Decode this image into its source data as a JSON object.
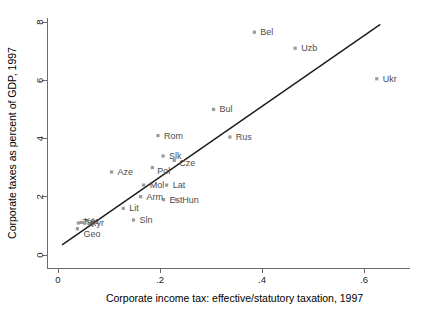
{
  "chart_data": {
    "type": "scatter",
    "title": "",
    "xlabel": "Corporate income tax: effective/statutory taxation, 1997",
    "ylabel": "Corporate taxes as percent of GDP, 1997",
    "xlim": [
      0,
      0.66
    ],
    "ylim": [
      0,
      8.3
    ],
    "xticks": [
      0,
      0.2,
      0.4,
      0.6
    ],
    "xticklabels": [
      "0",
      ".2",
      ".4",
      ".6"
    ],
    "yticks": [
      0,
      2,
      4,
      6,
      8
    ],
    "yticklabels": [
      "0",
      "2",
      "4",
      "6",
      "8"
    ],
    "grid": false,
    "legend": false,
    "marker_color": "#9a9a9a",
    "label_color": "#4d4d4d",
    "line_color": "#1a1a1a",
    "points": [
      {
        "label": "Geo",
        "x": 0.038,
        "y": 0.9,
        "label_dx": 6,
        "label_dy": 8
      },
      {
        "label": "Taj",
        "x": 0.04,
        "y": 1.1,
        "label_dx": 4,
        "label_dy": 2
      },
      {
        "label": "Kaz",
        "x": 0.046,
        "y": 1.12,
        "label_dx": 3,
        "label_dy": 2
      },
      {
        "label": "Kyr",
        "x": 0.052,
        "y": 1.1,
        "label_dx": 6,
        "label_dy": 3
      },
      {
        "label": "Sln",
        "x": 0.148,
        "y": 1.2,
        "label_dx": 6,
        "label_dy": 3
      },
      {
        "label": "Lit",
        "x": 0.128,
        "y": 1.6,
        "label_dx": 6,
        "label_dy": 3
      },
      {
        "label": "Est",
        "x": 0.207,
        "y": 1.9,
        "label_dx": 6,
        "label_dy": 3
      },
      {
        "label": "Hun",
        "x": 0.232,
        "y": 1.9,
        "label_dx": 6,
        "label_dy": 3
      },
      {
        "label": "Arm",
        "x": 0.162,
        "y": 2.0,
        "label_dx": 6,
        "label_dy": 3
      },
      {
        "label": "Mol",
        "x": 0.168,
        "y": 2.4,
        "label_dx": 6,
        "label_dy": 3
      },
      {
        "label": "Lat",
        "x": 0.213,
        "y": 2.4,
        "label_dx": 6,
        "label_dy": 3
      },
      {
        "label": "Aze",
        "x": 0.105,
        "y": 2.85,
        "label_dx": 6,
        "label_dy": 3
      },
      {
        "label": "Pol",
        "x": 0.185,
        "y": 3.0,
        "label_dx": 5,
        "label_dy": 6
      },
      {
        "label": "Cze",
        "x": 0.228,
        "y": 3.25,
        "label_dx": 5,
        "label_dy": 6
      },
      {
        "label": "Slk",
        "x": 0.206,
        "y": 3.4,
        "label_dx": 6,
        "label_dy": 3
      },
      {
        "label": "Rus",
        "x": 0.337,
        "y": 4.05,
        "label_dx": 6,
        "label_dy": 3
      },
      {
        "label": "Rom",
        "x": 0.196,
        "y": 4.1,
        "label_dx": 6,
        "label_dy": 3
      },
      {
        "label": "Bul",
        "x": 0.305,
        "y": 5.0,
        "label_dx": 6,
        "label_dy": 3
      },
      {
        "label": "Ukr",
        "x": 0.625,
        "y": 6.05,
        "label_dx": 6,
        "label_dy": 3
      },
      {
        "label": "Uzb",
        "x": 0.465,
        "y": 7.1,
        "label_dx": 6,
        "label_dy": 3
      },
      {
        "label": "Bel",
        "x": 0.385,
        "y": 7.65,
        "label_dx": 6,
        "label_dy": 3
      }
    ],
    "fit_line": {
      "x1": 0.008,
      "y1": 0.35,
      "x2": 0.632,
      "y2": 7.92
    }
  }
}
